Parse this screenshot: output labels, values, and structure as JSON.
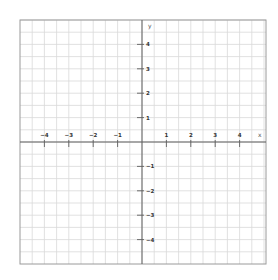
{
  "plane": {
    "title": "Coordinate plane",
    "x_axis_label": "x",
    "y_axis_label": "y",
    "x_range": [
      -5,
      5
    ],
    "y_range": [
      -5,
      5
    ],
    "x_ticks": [
      -4,
      -3,
      -2,
      -1,
      1,
      2,
      3,
      4
    ],
    "y_ticks": [
      4,
      3,
      2,
      1,
      -1,
      -2,
      -3,
      -4
    ],
    "grid_step": 0.5,
    "colors": {
      "background": "#ffffff",
      "grid": "#d9d9d9",
      "border": "#9a9a9a",
      "axis": "#5f5f5f",
      "label": "#333333"
    }
  },
  "layout": {
    "origin_px": [
      142,
      142
    ],
    "unit_px": 24.4,
    "border_px": {
      "left": 20,
      "top": 20,
      "right": 266,
      "bottom": 264
    }
  }
}
